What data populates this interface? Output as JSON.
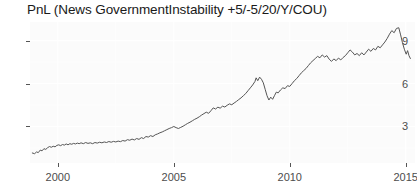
{
  "chart": {
    "title": "PnL (News GovernmentInstability +5/-5/20/Y/COU)",
    "y_ticks": [
      "3",
      "6",
      "9"
    ],
    "x_ticks": [
      "2000",
      "2005",
      "2010",
      "2015"
    ]
  },
  "chart_data": {
    "type": "line",
    "title": "PnL (News GovernmentInstability +5/-5/20/Y/COU)",
    "xlabel": "",
    "ylabel": "",
    "xlim": [
      1998.8,
      2015.4
    ],
    "ylim": [
      0.45,
      10.3
    ],
    "xticks": [
      2000,
      2005,
      2010,
      2015
    ],
    "yticks": [
      3,
      6,
      9
    ],
    "grid": true,
    "legend": false,
    "line_color": "#555555",
    "panel_color": "#fbfbfb",
    "grid_color": "#ffffff",
    "series": [
      {
        "name": "PnL",
        "x": [
          1998.9,
          1999.0,
          1999.08,
          1999.16,
          1999.24,
          1999.32,
          1999.4,
          1999.48,
          1999.56,
          1999.64,
          1999.72,
          1999.8,
          1999.88,
          1999.96,
          2000.04,
          2000.12,
          2000.2,
          2000.28,
          2000.36,
          2000.44,
          2000.52,
          2000.6,
          2000.68,
          2000.76,
          2000.84,
          2000.92,
          2001.0,
          2001.1,
          2001.2,
          2001.3,
          2001.4,
          2001.5,
          2001.6,
          2001.7,
          2001.8,
          2001.9,
          2002.0,
          2002.1,
          2002.2,
          2002.3,
          2002.4,
          2002.5,
          2002.6,
          2002.7,
          2002.8,
          2002.9,
          2003.0,
          2003.1,
          2003.2,
          2003.3,
          2003.4,
          2003.5,
          2003.6,
          2003.7,
          2003.8,
          2003.9,
          2004.0,
          2004.1,
          2004.2,
          2004.3,
          2004.4,
          2004.5,
          2004.6,
          2004.7,
          2004.8,
          2004.9,
          2005.0,
          2005.1,
          2005.2,
          2005.3,
          2005.4,
          2005.5,
          2005.6,
          2005.7,
          2005.8,
          2005.9,
          2006.0,
          2006.1,
          2006.2,
          2006.3,
          2006.4,
          2006.5,
          2006.6,
          2006.7,
          2006.8,
          2006.9,
          2007.0,
          2007.1,
          2007.2,
          2007.3,
          2007.4,
          2007.5,
          2007.6,
          2007.7,
          2007.8,
          2007.9,
          2008.0,
          2008.1,
          2008.2,
          2008.3,
          2008.4,
          2008.5,
          2008.55,
          2008.62,
          2008.7,
          2008.78,
          2008.86,
          2008.94,
          2009.02,
          2009.1,
          2009.18,
          2009.26,
          2009.34,
          2009.42,
          2009.5,
          2009.6,
          2009.7,
          2009.8,
          2009.9,
          2010.0,
          2010.1,
          2010.2,
          2010.3,
          2010.4,
          2010.5,
          2010.6,
          2010.7,
          2010.8,
          2010.9,
          2011.0,
          2011.1,
          2011.2,
          2011.3,
          2011.4,
          2011.5,
          2011.6,
          2011.7,
          2011.8,
          2011.9,
          2012.0,
          2012.1,
          2012.2,
          2012.3,
          2012.4,
          2012.5,
          2012.6,
          2012.7,
          2012.8,
          2012.9,
          2013.0,
          2013.1,
          2013.2,
          2013.3,
          2013.4,
          2013.5,
          2013.6,
          2013.7,
          2013.8,
          2013.9,
          2014.0,
          2014.1,
          2014.2,
          2014.3,
          2014.4,
          2014.5,
          2014.6,
          2014.7,
          2014.78,
          2014.86,
          2014.94,
          2015.02,
          2015.08,
          2015.14,
          2015.2
        ],
        "y": [
          1.15,
          1.1,
          1.22,
          1.18,
          1.35,
          1.3,
          1.45,
          1.4,
          1.52,
          1.6,
          1.55,
          1.62,
          1.58,
          1.68,
          1.72,
          1.66,
          1.74,
          1.7,
          1.78,
          1.72,
          1.8,
          1.76,
          1.82,
          1.78,
          1.84,
          1.8,
          1.86,
          1.8,
          1.88,
          1.82,
          1.86,
          1.8,
          1.88,
          1.84,
          1.9,
          1.86,
          1.92,
          1.88,
          1.95,
          1.9,
          1.96,
          1.92,
          1.98,
          1.94,
          2.02,
          1.98,
          2.08,
          2.04,
          2.12,
          2.06,
          2.16,
          2.1,
          2.22,
          2.16,
          2.3,
          2.26,
          2.36,
          2.3,
          2.42,
          2.48,
          2.56,
          2.62,
          2.7,
          2.78,
          2.86,
          2.92,
          3.0,
          2.92,
          2.86,
          2.94,
          3.02,
          3.12,
          3.22,
          3.3,
          3.4,
          3.5,
          3.58,
          3.68,
          3.8,
          3.9,
          4.0,
          3.92,
          4.1,
          4.3,
          4.22,
          4.35,
          4.28,
          4.42,
          4.36,
          4.48,
          4.58,
          4.52,
          4.64,
          4.75,
          4.88,
          5.0,
          5.15,
          5.3,
          5.5,
          5.7,
          5.9,
          6.15,
          6.4,
          6.2,
          6.45,
          6.3,
          6.05,
          5.6,
          5.15,
          4.85,
          5.05,
          4.9,
          5.15,
          5.4,
          5.35,
          5.55,
          5.7,
          5.65,
          5.85,
          5.8,
          6.0,
          6.2,
          6.35,
          6.55,
          6.75,
          6.9,
          7.05,
          7.25,
          7.45,
          7.6,
          7.75,
          7.9,
          7.8,
          8.0,
          7.85,
          7.95,
          7.7,
          7.55,
          7.72,
          7.6,
          7.78,
          7.65,
          7.82,
          7.95,
          8.15,
          8.35,
          8.2,
          8.0,
          8.1,
          7.95,
          8.15,
          8.0,
          8.2,
          8.4,
          8.25,
          8.45,
          8.35,
          8.6,
          8.5,
          8.7,
          8.9,
          9.15,
          9.45,
          9.7,
          9.55,
          9.85,
          9.9,
          9.4,
          8.85,
          8.4,
          8.05,
          8.3,
          7.95,
          7.75
        ]
      }
    ]
  }
}
